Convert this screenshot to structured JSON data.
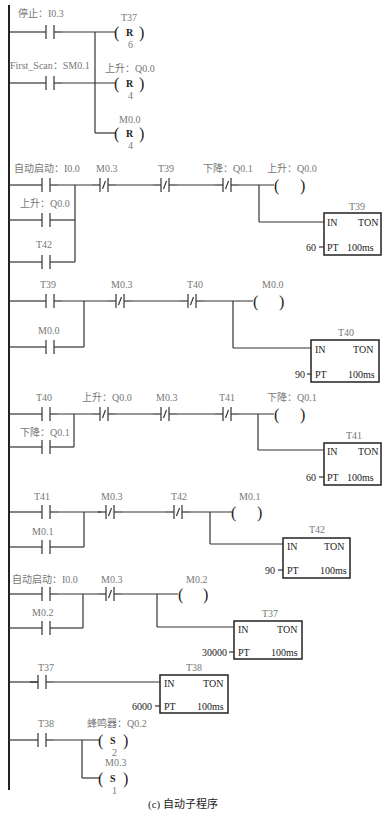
{
  "caption": "(c) 自动子程序",
  "networks": [
    {
      "id": 1,
      "contacts": [
        {
          "label": "停止：I0.3",
          "type": "NO"
        },
        {
          "label": "First_Scan：SM0.1",
          "type": "NO"
        }
      ],
      "outputs": [
        {
          "label": "T37",
          "coil": "R",
          "count": "6"
        },
        {
          "label": "上升：Q0.0",
          "coil": "R",
          "count": "4"
        },
        {
          "label": "M0.0",
          "coil": "R",
          "count": "4"
        }
      ]
    },
    {
      "id": 2,
      "contacts": [
        {
          "label": "自动启动：I0.0",
          "type": "NO"
        },
        {
          "label": "上升：Q0.0",
          "type": "NO"
        },
        {
          "label": "T42",
          "type": "NO"
        },
        {
          "label": "M0.3",
          "type": "NC"
        },
        {
          "label": "T39",
          "type": "NC"
        },
        {
          "label": "下降：Q0.1",
          "type": "NC"
        }
      ],
      "coil": {
        "label": "上升：Q0.0"
      },
      "timer": {
        "name": "T39",
        "in": "IN",
        "type": "TON",
        "pt_label": "PT",
        "pt": "60",
        "base": "100ms"
      }
    },
    {
      "id": 3,
      "contacts": [
        {
          "label": "T39",
          "type": "NO"
        },
        {
          "label": "M0.0",
          "type": "NO"
        },
        {
          "label": "M0.3",
          "type": "NC"
        },
        {
          "label": "T40",
          "type": "NC"
        }
      ],
      "coil": {
        "label": "M0.0"
      },
      "timer": {
        "name": "T40",
        "in": "IN",
        "type": "TON",
        "pt_label": "PT",
        "pt": "90",
        "base": "100ms"
      }
    },
    {
      "id": 4,
      "contacts": [
        {
          "label": "T40",
          "type": "NO"
        },
        {
          "label": "下降：Q0.1",
          "type": "NO"
        },
        {
          "label": "上升：Q0.0",
          "type": "NC"
        },
        {
          "label": "M0.3",
          "type": "NC"
        },
        {
          "label": "T41",
          "type": "NC"
        }
      ],
      "coil": {
        "label": "下降：Q0.1"
      },
      "timer": {
        "name": "T41",
        "in": "IN",
        "type": "TON",
        "pt_label": "PT",
        "pt": "60",
        "base": "100ms"
      }
    },
    {
      "id": 5,
      "contacts": [
        {
          "label": "T41",
          "type": "NO"
        },
        {
          "label": "M0.1",
          "type": "NO"
        },
        {
          "label": "M0.3",
          "type": "NC"
        },
        {
          "label": "T42",
          "type": "NC"
        }
      ],
      "coil": {
        "label": "M0.1"
      },
      "timer": {
        "name": "T42",
        "in": "IN",
        "type": "TON",
        "pt_label": "PT",
        "pt": "90",
        "base": "100ms"
      }
    },
    {
      "id": 6,
      "contacts": [
        {
          "label": "自动启动：I0.0",
          "type": "NO"
        },
        {
          "label": "M0.2",
          "type": "NO"
        },
        {
          "label": "M0.3",
          "type": "NC"
        }
      ],
      "coil": {
        "label": "M0.2"
      },
      "timer": {
        "name": "T37",
        "in": "IN",
        "type": "TON",
        "pt_label": "PT",
        "pt": "30000",
        "base": "100ms"
      }
    },
    {
      "id": 7,
      "contacts": [
        {
          "label": "T37",
          "type": "NO"
        }
      ],
      "timer": {
        "name": "T38",
        "in": "IN",
        "type": "TON",
        "pt_label": "PT",
        "pt": "6000",
        "base": "100ms"
      }
    },
    {
      "id": 8,
      "contacts": [
        {
          "label": "T38",
          "type": "NO"
        }
      ],
      "outputs": [
        {
          "label": "蜂鸣器：Q0.2",
          "coil": "S",
          "count": "2"
        },
        {
          "label": "M0.3",
          "coil": "S",
          "count": "1"
        }
      ]
    }
  ]
}
